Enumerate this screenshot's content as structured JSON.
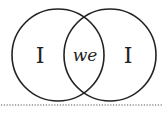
{
  "diagram": {
    "type": "venn",
    "left_circle": {
      "label": "I"
    },
    "right_circle": {
      "label": "I"
    },
    "intersection": {
      "label": "we"
    },
    "stroke_color": "#222222",
    "divider": {
      "style": "dotted",
      "color": "#555555"
    }
  }
}
